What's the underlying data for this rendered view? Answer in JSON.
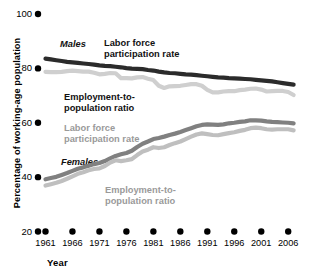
{
  "chart_data": {
    "type": "line",
    "title": "",
    "xlabel": "Year",
    "ylabel": "Percentage of working-age population",
    "ylim": [
      20,
      100
    ],
    "xlim": [
      1961,
      2008
    ],
    "grid": false,
    "legend": "inline-annotations",
    "ytick_labels": [
      "100",
      "80",
      "60",
      "40",
      "20"
    ],
    "ytick_values": [
      100,
      80,
      60,
      40,
      20
    ],
    "xtick_labels": [
      "1961",
      "1966",
      "1971",
      "1976",
      "1981",
      "1986",
      "1991",
      "1996",
      "2001",
      "2006"
    ],
    "xtick_values": [
      1961,
      1966,
      1971,
      1976,
      1981,
      1986,
      1991,
      1996,
      2001,
      2006
    ],
    "x": [
      1961,
      1962,
      1963,
      1964,
      1965,
      1966,
      1967,
      1968,
      1969,
      1970,
      1971,
      1972,
      1973,
      1974,
      1975,
      1976,
      1977,
      1978,
      1979,
      1980,
      1981,
      1982,
      1983,
      1984,
      1985,
      1986,
      1987,
      1988,
      1989,
      1990,
      1991,
      1992,
      1993,
      1994,
      1995,
      1996,
      1997,
      1998,
      1999,
      2000,
      2001,
      2002,
      2003,
      2004,
      2005,
      2006,
      2007
    ],
    "series": [
      {
        "name": "Males labor force participation rate",
        "color": "#2b2b2b",
        "values": [
          83.6,
          83.3,
          83.0,
          82.7,
          82.4,
          82.2,
          82.0,
          81.8,
          81.6,
          81.4,
          81.1,
          80.9,
          80.8,
          80.6,
          80.4,
          80.1,
          79.9,
          79.8,
          79.7,
          79.4,
          79.2,
          78.8,
          78.5,
          78.3,
          78.2,
          78.0,
          77.8,
          77.7,
          77.5,
          77.3,
          77.1,
          76.9,
          76.7,
          76.6,
          76.4,
          76.3,
          76.2,
          76.1,
          76.0,
          75.8,
          75.6,
          75.4,
          75.2,
          74.9,
          74.6,
          74.3,
          74.0
        ]
      },
      {
        "name": "Males employment-to-population ratio",
        "color": "#cfcfcf",
        "values": [
          78.7,
          78.6,
          78.6,
          78.7,
          79.0,
          79.2,
          79.0,
          78.8,
          78.8,
          78.4,
          77.8,
          78.0,
          78.3,
          78.2,
          76.4,
          76.4,
          76.3,
          76.7,
          76.8,
          76.2,
          75.7,
          73.6,
          72.8,
          73.4,
          73.5,
          73.6,
          73.9,
          74.2,
          74.2,
          73.6,
          72.1,
          71.2,
          71.2,
          71.5,
          71.6,
          71.6,
          72.0,
          72.2,
          72.5,
          72.6,
          72.2,
          71.5,
          71.6,
          71.7,
          71.7,
          71.3,
          70.2
        ]
      },
      {
        "name": "Females labor force participation rate",
        "color": "#808080",
        "values": [
          39.2,
          39.7,
          40.1,
          40.8,
          41.5,
          42.3,
          43.1,
          43.6,
          44.2,
          44.8,
          45.2,
          45.9,
          46.9,
          47.8,
          48.4,
          48.9,
          49.7,
          51.1,
          52.3,
          53.1,
          54.0,
          54.4,
          54.9,
          55.5,
          56.0,
          56.6,
          57.3,
          58.0,
          58.7,
          59.2,
          59.4,
          59.3,
          59.2,
          59.4,
          59.8,
          60.0,
          60.3,
          60.5,
          60.9,
          60.9,
          60.8,
          60.5,
          60.3,
          60.2,
          60.1,
          60.0,
          59.8
        ]
      },
      {
        "name": "Females employment-to-population ratio",
        "color": "#bfbfbf",
        "values": [
          36.9,
          37.4,
          37.9,
          38.6,
          39.4,
          40.3,
          41.2,
          41.8,
          42.5,
          43.0,
          43.2,
          44.1,
          45.4,
          46.2,
          45.9,
          46.2,
          46.6,
          48.1,
          49.4,
          50.1,
          51.0,
          50.7,
          51.0,
          51.8,
          52.5,
          53.1,
          54.0,
          54.9,
          55.7,
          56.1,
          55.8,
          55.5,
          55.4,
          55.8,
          56.2,
          56.5,
          57.0,
          57.4,
          58.0,
          58.2,
          58.0,
          57.6,
          57.5,
          57.6,
          57.6,
          57.6,
          57.2
        ]
      }
    ],
    "annotations": [
      {
        "id": "males",
        "text": "Males",
        "style": "bold-italic",
        "color": "#111111"
      },
      {
        "id": "males-lfp",
        "text": "Labor force\nparticipation rate",
        "style": "bold",
        "color": "#111111"
      },
      {
        "id": "males-epr",
        "text": "Employment-to-\npopulation ratio",
        "style": "bold",
        "color": "#111111"
      },
      {
        "id": "females-lfp",
        "text": "Labor force\nparticipation rate",
        "style": "bold",
        "color": "#9a9a9a"
      },
      {
        "id": "females",
        "text": "Females",
        "style": "bold-italic",
        "color": "#111111"
      },
      {
        "id": "females-epr",
        "text": "Employment-to-\npopulation ratio",
        "style": "bold",
        "color": "#9a9a9a"
      }
    ]
  },
  "axes": {
    "y_title": "Percentage of working-age population",
    "x_title": "Year"
  }
}
